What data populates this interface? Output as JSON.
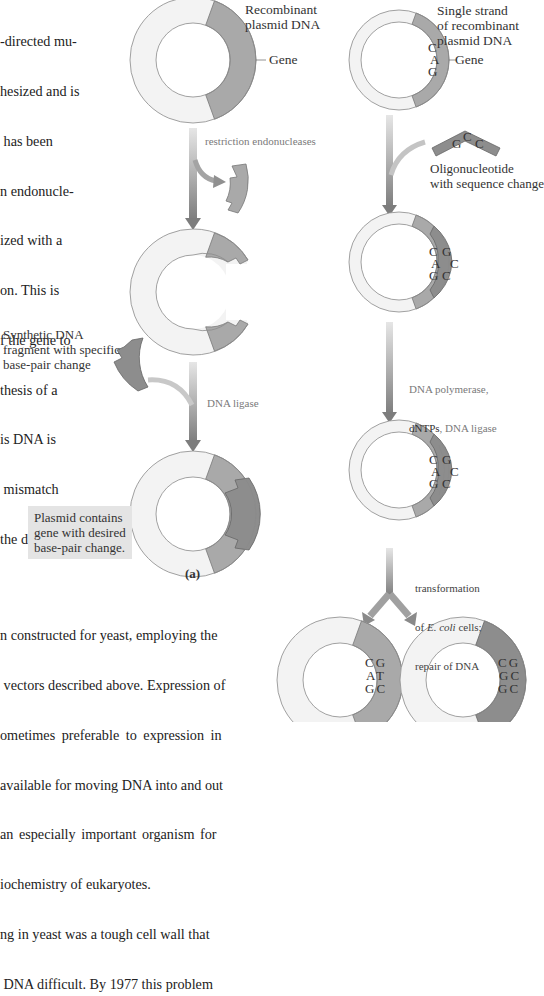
{
  "intro_text": {
    "lines": [
      "-directed mu-",
      "hesized and is",
      " has been",
      "n endonucle-",
      "ized with a",
      "on. This is",
      "f the gene to",
      "thesis of a",
      "is DNA is",
      " mismatch",
      "the desired"
    ]
  },
  "panel_a": {
    "title_label": "Recombinant\nplasmid DNA",
    "gene_label": "Gene",
    "step1_label": "restriction endonucleases",
    "fragment_label": "Synthetic DNA\nfragment with specific\nbase-pair change",
    "step2_label": "DNA ligase",
    "result_box": "Plasmid contains\ngene with desired\nbase-pair change.",
    "figure_label": "(a)"
  },
  "panel_b": {
    "title_label": "Single strand\nof recombinant\nplasmid DNA",
    "gene_label": "Gene",
    "gene_bases": [
      "C",
      "A",
      "G"
    ],
    "oligo_bases": [
      "G",
      "C",
      "C"
    ],
    "oligo_label": "Oligonucleotide\nwith sequence change",
    "hybrid_bases_left": [
      "C",
      "A",
      "G"
    ],
    "hybrid_bases_right": [
      "G",
      "C",
      "C"
    ],
    "step2_label_line1": "DNA polymerase,",
    "step2_label_line2_dark": "dNTPs",
    "step2_label_line2_rest": ", DNA ligase",
    "step3_line1": "transformation",
    "step3_line2_pre": "of ",
    "step3_line2_italic": "E. coli",
    "step3_line2_post": " cells;",
    "step3_line3": "repair of DNA",
    "result_left_pairs": [
      [
        "C",
        "G"
      ],
      [
        "A",
        "T"
      ],
      [
        "G",
        "C"
      ]
    ],
    "result_right_pairs": [
      [
        "C",
        "G"
      ],
      [
        "G",
        "C"
      ],
      [
        "G",
        "C"
      ]
    ]
  },
  "bottom_text": {
    "lines": [
      "n constructed for yeast, employing the",
      " vectors described above. Expression of",
      "ometimes preferable to expression in",
      "available for moving DNA into and out",
      "an especially important organism for",
      "iochemistry of eukaryotes.",
      "ng in yeast was a tough cell wall that",
      " DNA difficult. By 1977 this problem"
    ]
  },
  "colors": {
    "ring_light": "#f3f3f3",
    "ring_outline": "#8a8a8a",
    "gene_gray": "#a9a9a9",
    "fragment_dark": "#8d8d8d",
    "arrow_gray": "#9a9a9a",
    "box_bg": "#e4e4e4"
  }
}
